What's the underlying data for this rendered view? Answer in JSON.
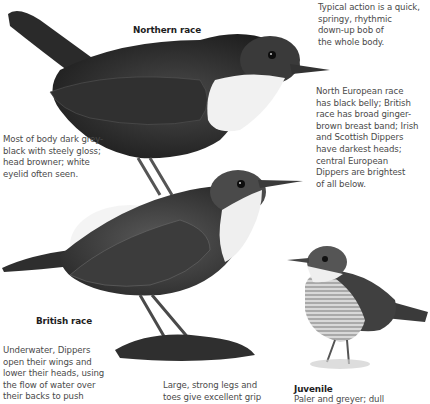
{
  "page": {
    "background": "#ffffff",
    "text_color": "#4a4a4a",
    "label_color": "#1e1e1e"
  },
  "illustrations": [
    {
      "name": "northern-race-dipper",
      "label": "Northern race"
    },
    {
      "name": "british-race-dipper",
      "label": "British race"
    },
    {
      "name": "juvenile-dipper",
      "label": "Juvenile"
    }
  ],
  "labels": {
    "northern": "Northern race",
    "british": "British race",
    "juvenile": "Juvenile"
  },
  "notes": {
    "action": [
      "Typical action is a quick,",
      "springy, rhythmic",
      "down-up bob of",
      "the whole body."
    ],
    "races": [
      "North European race",
      "has black belly; British",
      "race has broad ginger-",
      "brown breast band; Irish",
      "and Scottish Dippers",
      "have darkest heads;",
      "central European",
      "Dippers are brightest",
      "of all below."
    ],
    "body": [
      "Most of body dark grey-",
      "black with steely gloss;",
      "head browner; white",
      "eyelid often seen."
    ],
    "underwater": [
      "Underwater, Dippers",
      "open their wings and",
      "lower their heads, using",
      "the flow of water over",
      "their backs to push"
    ],
    "legs": [
      "Large, strong legs and",
      "toes give excellent grip"
    ],
    "juvenile": [
      "Paler and greyer; dull"
    ]
  }
}
